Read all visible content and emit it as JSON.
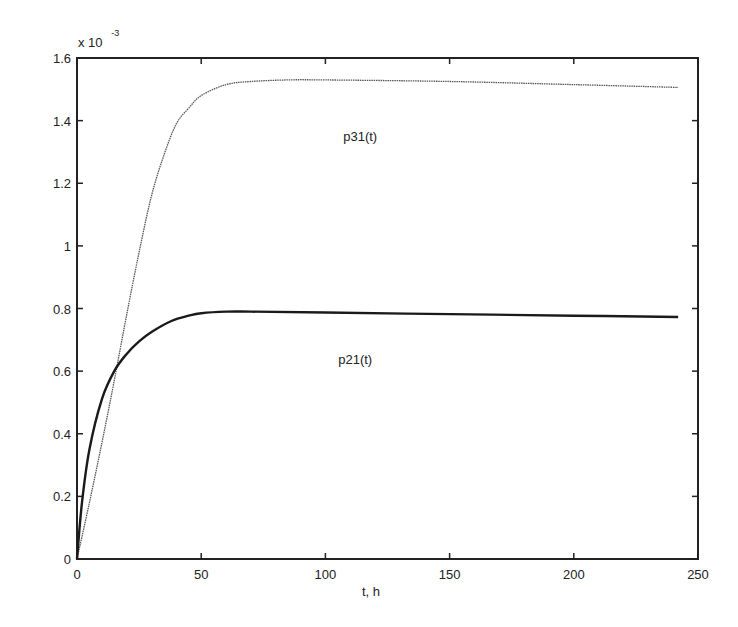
{
  "chart_data": {
    "type": "line",
    "title": "",
    "xlabel": "t, h",
    "ylabel": "",
    "y_scale_note": "x 10^-3",
    "y_multiplier_base": "x 10",
    "y_multiplier_exp": "-3",
    "xlim": [
      0,
      250
    ],
    "ylim": [
      0,
      1.6
    ],
    "grid": false,
    "legend": "none (inline curve annotations)",
    "x_ticks": [
      0,
      50,
      100,
      150,
      200,
      250
    ],
    "x_tick_labels": [
      "0",
      "50",
      "100",
      "150",
      "200",
      "250"
    ],
    "y_ticks": [
      0,
      0.2,
      0.4,
      0.6,
      0.8,
      1,
      1.2,
      1.4,
      1.6
    ],
    "y_tick_labels": [
      "0",
      "0.2",
      "0.4",
      "0.6",
      "0.8",
      "1",
      "1.2",
      "1.4",
      "1.6"
    ],
    "series": [
      {
        "name": "p31(t)",
        "style": "thin dotted gray",
        "color": "#555555",
        "x": [
          0,
          5,
          10,
          15,
          20,
          25,
          30,
          35,
          40,
          45,
          50,
          60,
          70,
          85,
          100,
          150,
          200,
          242
        ],
        "values": [
          0,
          0.18,
          0.37,
          0.57,
          0.78,
          0.98,
          1.16,
          1.29,
          1.39,
          1.44,
          1.48,
          1.515,
          1.525,
          1.53,
          1.53,
          1.525,
          1.515,
          1.506
        ]
      },
      {
        "name": "p21(t)",
        "style": "thick solid black",
        "color": "#1a1a1a",
        "x": [
          0,
          2,
          5,
          10,
          15,
          20,
          25,
          30,
          38,
          45,
          50,
          60,
          70,
          100,
          150,
          200,
          242
        ],
        "values": [
          0,
          0.18,
          0.35,
          0.51,
          0.6,
          0.655,
          0.695,
          0.725,
          0.76,
          0.777,
          0.785,
          0.79,
          0.79,
          0.787,
          0.782,
          0.777,
          0.773
        ]
      }
    ],
    "annotations": [
      {
        "text": "p31(t)",
        "x": 114,
        "y": 1.35
      },
      {
        "text": "p21(t)",
        "x": 112,
        "y": 0.64
      }
    ]
  }
}
